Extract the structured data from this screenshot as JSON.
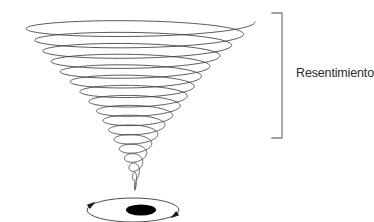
{
  "canvas": {
    "width": 372,
    "height": 222,
    "background_color": "#ffffff"
  },
  "diagram": {
    "title_text": "Resentimiento",
    "stroke_color": "#3a3a3a",
    "fill_color": "#000000",
    "bracket_color": "#808080"
  },
  "annotation": {
    "label": "Resentimiento",
    "bracket": {
      "top_y": 13,
      "bottom_y": 138,
      "x": 282,
      "tick_length": 10
    }
  },
  "chart_data": {
    "type": "line",
    "title": "Resentimiento",
    "xlabel": "",
    "ylabel": "",
    "vortex": {
      "center_x": 135,
      "top_y": 22,
      "tip_y": 190,
      "top_radius_x": 117,
      "top_radius_y": 11,
      "turns": 17,
      "taper": "exponential",
      "drift_x_top": 3,
      "line_width": 0.85
    },
    "bottom_ellipse": {
      "center_x": 133,
      "center_y": 210,
      "radius_x": 46,
      "radius_y": 12,
      "arrow_positions_deg": [
        200,
        20
      ],
      "line_width": 0.9
    },
    "black_dot": {
      "center_x": 141,
      "center_y": 210,
      "radius_x": 15,
      "radius_y": 5.5,
      "color": "#000000"
    },
    "series": [
      {
        "name": "spiral-radius-by-turn",
        "values": [
          117,
          112,
          106,
          99,
          92,
          85,
          78,
          70,
          63,
          55,
          48,
          41,
          34,
          27,
          20,
          14,
          8,
          3
        ]
      },
      {
        "name": "spiral-y-by-turn",
        "values": [
          22,
          32,
          42,
          51,
          60,
          69,
          78,
          87,
          96,
          105,
          114,
          123,
          132,
          143,
          154,
          165,
          176,
          188
        ]
      }
    ],
    "legend": [],
    "grid": false
  }
}
